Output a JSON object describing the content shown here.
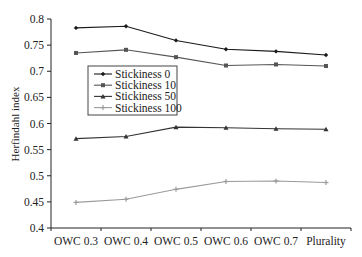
{
  "chart_data": {
    "type": "line",
    "title": "",
    "xlabel": "",
    "ylabel": "Herfindahl index",
    "ylim": [
      0.4,
      0.8
    ],
    "yticks": [
      0.4,
      0.45,
      0.5,
      0.55,
      0.6,
      0.65,
      0.7,
      0.75,
      0.8
    ],
    "ytick_labels": [
      "0.4",
      "0.45",
      "0.5",
      "0.55",
      "0.6",
      "0.65",
      "0.7",
      "0.75",
      "0.8"
    ],
    "categories": [
      "OWC 0.3",
      "OWC 0.4",
      "OWC 0.5",
      "OWC 0.6",
      "OWC 0.7",
      "Plurality"
    ],
    "grid": false,
    "legend_position": "inside-left-middle",
    "series": [
      {
        "name": "Stickiness 0",
        "color": "#1a1a1a",
        "marker": "diamond",
        "values": [
          0.783,
          0.786,
          0.759,
          0.742,
          0.738,
          0.731
        ]
      },
      {
        "name": "Stickiness 10",
        "color": "#555555",
        "marker": "square",
        "values": [
          0.735,
          0.741,
          0.727,
          0.711,
          0.713,
          0.71
        ]
      },
      {
        "name": "Stickiness 50",
        "color": "#333333",
        "marker": "triangle",
        "values": [
          0.571,
          0.575,
          0.593,
          0.592,
          0.59,
          0.589
        ]
      },
      {
        "name": "Stickiness 100",
        "color": "#9a9a9a",
        "marker": "cross",
        "values": [
          0.449,
          0.455,
          0.474,
          0.489,
          0.49,
          0.487
        ]
      }
    ]
  }
}
